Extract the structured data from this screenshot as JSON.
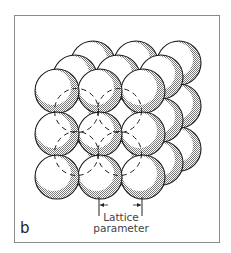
{
  "figure": {
    "panel_label": "b",
    "caption_line1": "Lattice",
    "caption_line2": "parameter",
    "colors": {
      "frame": "#8a8a8a",
      "sphere_fill": "#ffffff",
      "sphere_shade": "#9a9a9a",
      "outline": "#1a1a1a"
    },
    "lattice": {
      "rows": 3,
      "cols": 3,
      "layers": 3,
      "front_origin": [
        57,
        91
      ],
      "spacing": 43,
      "radius": 22,
      "layer_offset": [
        18,
        -14
      ]
    }
  }
}
